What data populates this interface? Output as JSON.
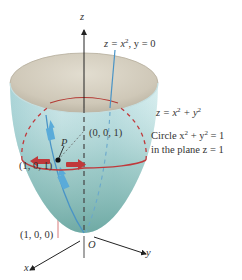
{
  "figure": {
    "colors": {
      "surface_outer": "#bfe0e3",
      "surface_shadow": "#86bcb8",
      "surface_inner": "#d3cdbf",
      "circle": "#c0393b",
      "curve": "#4a94c6",
      "arrow_blue": "#5aabd9",
      "arrow_red": "#c0393b",
      "axis": "#222222",
      "text": "#333333"
    },
    "axes": {
      "z_label": "z",
      "y_label": "y",
      "x_label": "x",
      "origin_label": "O"
    },
    "labels": {
      "parabola_eq_main": "z = x",
      "parabola_eq_exp": "2",
      "parabola_eq_tail": ", y = 0",
      "surface_eq_main": "z = x",
      "surface_eq_exp1": "2",
      "surface_eq_mid": " + y",
      "surface_eq_exp2": "2",
      "circle_line1_a": "Circle x",
      "circle_line1_exp1": "2",
      "circle_line1_b": " + y",
      "circle_line1_exp2": "2",
      "circle_line1_c": " = 1",
      "circle_line2": "in the plane z  =  1",
      "point_001": "(0, 0, 1)",
      "point_P": "P",
      "point_101": "(1, 0, 1)",
      "point_100": "(1, 0, 0)"
    }
  }
}
